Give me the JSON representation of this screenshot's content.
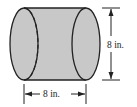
{
  "diagram": {
    "shape": "cylinder",
    "orientation": "horizontal",
    "fill_color": "#c8c8c8",
    "stroke_color": "#222222",
    "height_label": "8 in.",
    "length_label": "8 in."
  }
}
